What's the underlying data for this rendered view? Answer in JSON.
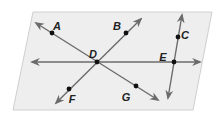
{
  "diagram": {
    "plane": {
      "points": [
        [
          33,
          12
        ],
        [
          212,
          12
        ],
        [
          193,
          110
        ],
        [
          13,
          110
        ]
      ],
      "fill": "#eeeeee",
      "stroke": "#cfcfcf"
    },
    "line_color": "#6b6b6b",
    "point_color": "#111111",
    "lines": [
      {
        "name": "line-AG",
        "from": [
          36,
          23
        ],
        "to": [
          158,
          100
        ]
      },
      {
        "name": "line-FB",
        "from": [
          56,
          103
        ],
        "to": [
          141,
          19
        ]
      },
      {
        "name": "line-horizontal-DE",
        "from": [
          32,
          62
        ],
        "to": [
          200,
          62
        ]
      },
      {
        "name": "line-CE",
        "from": [
          182,
          15
        ],
        "to": [
          168,
          98
        ]
      }
    ],
    "points": [
      {
        "label": "A",
        "x": 52,
        "y": 33,
        "lx": 57,
        "ly": 27
      },
      {
        "label": "B",
        "x": 126,
        "y": 33,
        "lx": 117,
        "ly": 27
      },
      {
        "label": "C",
        "x": 178,
        "y": 37,
        "lx": 185,
        "ly": 36
      },
      {
        "label": "D",
        "x": 97,
        "y": 62,
        "lx": 93,
        "ly": 55
      },
      {
        "label": "E",
        "x": 174,
        "y": 62,
        "lx": 163,
        "ly": 58
      },
      {
        "label": "F",
        "x": 69,
        "y": 89,
        "lx": 72,
        "ly": 100
      },
      {
        "label": "G",
        "x": 136,
        "y": 86,
        "lx": 126,
        "ly": 98
      }
    ]
  }
}
